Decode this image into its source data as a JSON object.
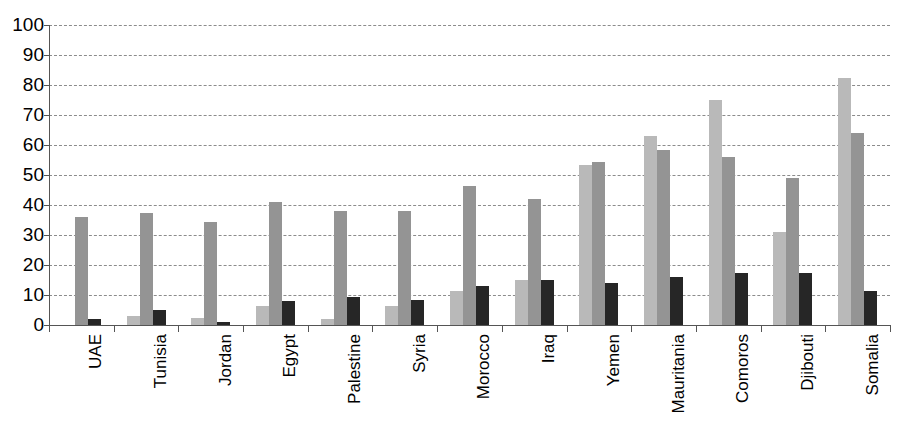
{
  "chart_data": {
    "type": "bar",
    "title": "",
    "xlabel": "",
    "ylabel": "",
    "ylim": [
      0,
      100
    ],
    "yticks": [
      0,
      10,
      20,
      30,
      40,
      50,
      60,
      70,
      80,
      90,
      100
    ],
    "grid": true,
    "legend": "none",
    "categories": [
      "UAE",
      "Tunisia",
      "Jordan",
      "Egypt",
      "Palestine",
      "Syria",
      "Morocco",
      "Iraq",
      "Yemen",
      "Mauritania",
      "Comoros",
      "Djibouti",
      "Somalia"
    ],
    "series": [
      {
        "name": "series-1",
        "color": "#b9b9b9",
        "values": [
          0,
          3,
          2.5,
          6.5,
          2,
          6.5,
          11.5,
          15,
          53.5,
          63,
          75,
          31,
          82.5
        ]
      },
      {
        "name": "series-2",
        "color": "#949494",
        "values": [
          36,
          37.5,
          34.5,
          41,
          38,
          38,
          46.5,
          42,
          54.5,
          58.5,
          56,
          49,
          64
        ]
      },
      {
        "name": "series-3",
        "color": "#262626",
        "values": [
          2,
          5,
          1,
          8,
          9.5,
          8.5,
          13,
          15,
          14,
          16,
          17.5,
          17.5,
          11.5
        ]
      }
    ]
  },
  "axis": {
    "y_tick_labels": [
      "100",
      "90",
      "80",
      "70",
      "60",
      "50",
      "40",
      "30",
      "20",
      "10",
      "0"
    ]
  }
}
